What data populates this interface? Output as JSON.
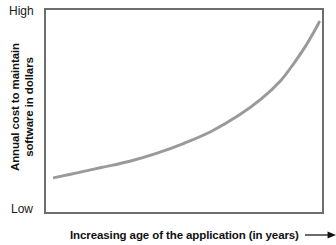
{
  "figure": {
    "background_color": "#ffffff",
    "frame_color": "#6e6e6e",
    "curve_color": "#9a9a9a",
    "text_color": "#111111"
  },
  "axes": {
    "y_top_label": "High",
    "y_bottom_label": "Low",
    "y_title_line1": "Annual cost to maintain",
    "y_title_line2": "software in dollars",
    "x_title": "Increasing age of the application (in years)",
    "x_arrow_icon": "right-arrow-icon"
  },
  "chart_data": {
    "type": "line",
    "title": "",
    "xlabel": "Increasing age of the application (in years)",
    "ylabel": "Annual cost to maintain software in dollars",
    "xlim": [
      0,
      100
    ],
    "ylim": [
      0,
      100
    ],
    "x_tick_labels": [],
    "y_tick_labels": [
      "Low",
      "High"
    ],
    "grid": false,
    "legend": false,
    "annotations": [
      "Arrow at end of x-axis label indicating increasing direction"
    ],
    "series": [
      {
        "name": "Annual maintenance cost",
        "x": [
          3,
          10,
          20,
          30,
          40,
          50,
          60,
          70,
          78,
          85,
          90,
          94,
          97,
          99
        ],
        "y": [
          17,
          19,
          22,
          25,
          29,
          34,
          40,
          48,
          56,
          65,
          74,
          82,
          89,
          94
        ]
      }
    ]
  }
}
